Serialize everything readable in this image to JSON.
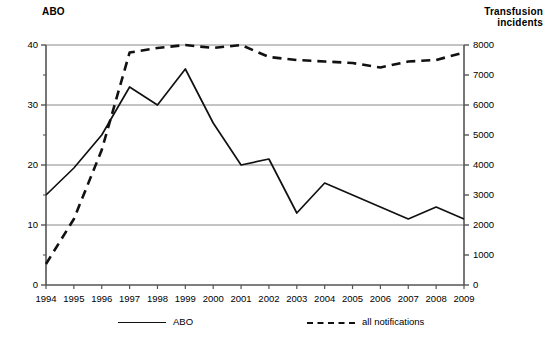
{
  "chart_data": {
    "type": "line",
    "title": "",
    "xlabel": "",
    "ylabel": "ABO",
    "y2label": "Transfusion incidents",
    "grid": true,
    "legend_position": "bottom",
    "categories": [
      "1994",
      "1995",
      "1996",
      "1997",
      "1998",
      "1999",
      "2000",
      "2001",
      "2002",
      "2003",
      "2004",
      "2005",
      "2006",
      "2007",
      "2008",
      "2009"
    ],
    "ylim": [
      0,
      40
    ],
    "yticks": [
      0,
      10,
      20,
      30,
      40
    ],
    "yticks_minor": [
      5,
      15,
      25,
      35
    ],
    "y2lim": [
      0,
      8000
    ],
    "y2ticks": [
      0,
      1000,
      2000,
      3000,
      4000,
      5000,
      6000,
      7000,
      8000
    ],
    "series": [
      {
        "name": "ABO",
        "axis": "left",
        "style": "solid",
        "values": [
          15,
          19.5,
          25,
          33,
          30,
          36,
          27,
          20,
          21,
          12,
          17,
          15,
          13,
          11,
          13,
          11
        ]
      },
      {
        "name": "all notifications",
        "axis": "right",
        "style": "dashed",
        "values": [
          700,
          2200,
          4500,
          7750,
          7900,
          8000,
          7900,
          8000,
          7600,
          7500,
          7450,
          7400,
          7250,
          7450,
          7500,
          7750
        ]
      }
    ]
  },
  "labels": {
    "left_axis_title": "ABO",
    "right_axis_title": "Transfusion\nincidents"
  },
  "legend": {
    "items": [
      {
        "label": "ABO",
        "style": "solid"
      },
      {
        "label": "all notifications",
        "style": "dashed"
      }
    ]
  },
  "colors": {
    "line": "#111111",
    "grid": "#888888",
    "axis": "#555555",
    "background": "#ffffff"
  }
}
